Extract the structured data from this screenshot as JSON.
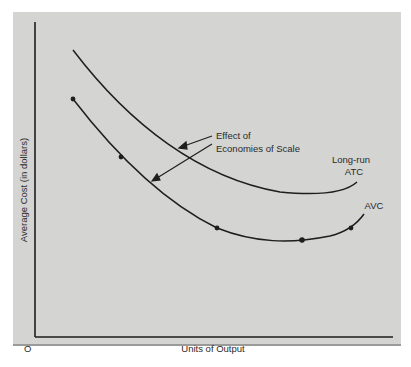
{
  "figure": {
    "y_axis_label": "Average Cost (in dollars)",
    "x_axis_label": "Units of Output",
    "origin_label": "O",
    "annotation": {
      "line1": "Effect of",
      "line2": "Economies of Scale"
    },
    "curves": [
      {
        "name": "Long-run ATC",
        "label_line1": "Long-run",
        "label_line2": "ATC"
      },
      {
        "name": "AVC",
        "label_line1": "AVC"
      }
    ]
  },
  "colors": {
    "background": "#d4d4d2",
    "ink": "#1e1e1e"
  }
}
